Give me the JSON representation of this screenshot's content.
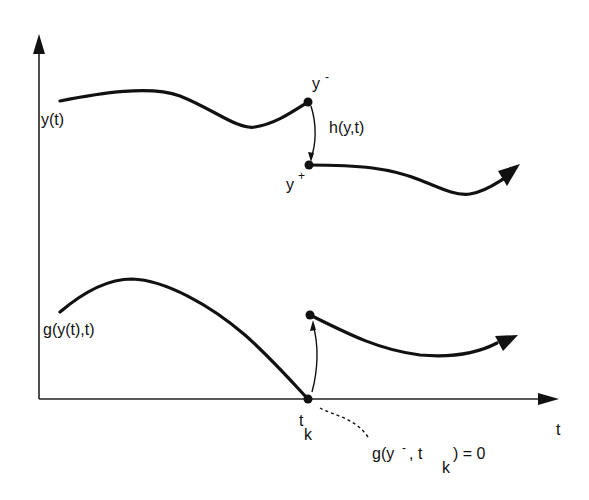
{
  "diagram": {
    "title": "",
    "axes": {
      "x_label": "t",
      "y_arrow": true
    },
    "labels": {
      "y_curve": "y(t)",
      "y_minus_base": "y",
      "y_minus_sup": "-",
      "y_plus_base": "y",
      "y_plus_sup": "+",
      "jump_map": "h(y,t)",
      "g_curve": "g(y(t),t)",
      "tk_base": "t",
      "tk_sub": "k",
      "event_eq_part1": "g(y",
      "event_eq_sup": "-",
      "event_eq_part2": ", t",
      "event_eq_sub": "k",
      "event_eq_part3": ") = 0"
    },
    "colors": {
      "stroke": "#111111",
      "background": "#ffffff"
    }
  }
}
